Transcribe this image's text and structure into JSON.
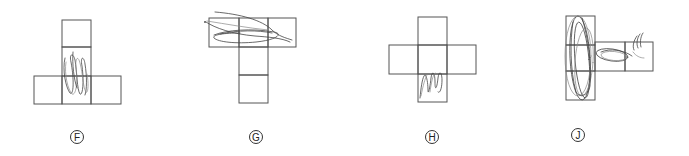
{
  "figures": [
    {
      "id": "F",
      "label": "F",
      "shape": "T-shape net (inverted): two squares stacked on top of a row of three",
      "squares": 5,
      "marking": "vertical loop scribbles in the middle square of the column"
    },
    {
      "id": "G",
      "label": "G",
      "shape": "T-shape net: row of three on top with two squares stacked below the middle",
      "squares": 5,
      "marking": "horizontal curved scribbles across the top row"
    },
    {
      "id": "H",
      "label": "H",
      "shape": "Cross-shaped net: one square above, row of three, one square below",
      "squares": 5,
      "marking": "loop scribbles in the bottom square"
    },
    {
      "id": "J",
      "label": "J",
      "shape": "Column of three with two squares extending right from the middle",
      "squares": 5,
      "marking": "large vertical oval loops over the column and horizontal oval across the right squares"
    }
  ],
  "colors": {
    "line": "#555555",
    "scribble": "#444444",
    "background": "#ffffff"
  }
}
